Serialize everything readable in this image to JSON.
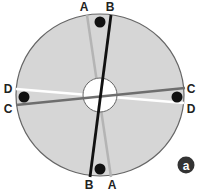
{
  "diagram": {
    "disc": {
      "fill": "#d6d6d6",
      "stroke": "#666666"
    },
    "lines": [
      {
        "id": "A",
        "color": "#b4b4b4"
      },
      {
        "id": "B",
        "color": "#111111"
      },
      {
        "id": "C",
        "color": "#6e6e6e"
      },
      {
        "id": "D",
        "color": "#ffffff"
      }
    ],
    "labels": {
      "top_left": "A",
      "top_right": "B",
      "left_top": "D",
      "left_bottom": "C",
      "right_top": "C",
      "right_bottom": "D",
      "bottom_left": "B",
      "bottom_right": "A"
    },
    "badge": "a"
  }
}
